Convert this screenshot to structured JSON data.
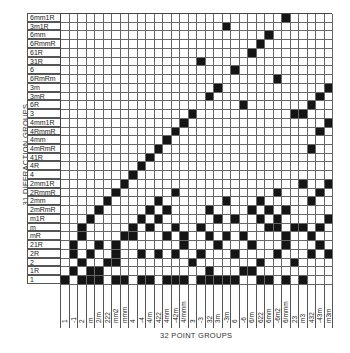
{
  "chart_data": {
    "type": "table",
    "title": "",
    "ylabel": "31 DIFFRACTION GROUPS",
    "xlabel": "32 POINT GROUPS",
    "rows": [
      "6mm1R",
      "3m1R",
      "6mm",
      "6RmmR",
      "61R",
      "31R",
      "6",
      "6RmRm",
      "3m",
      "3mR",
      "6R",
      "3",
      "4mm1R",
      "4RmmR",
      "4mm",
      "4mRmR",
      "41R",
      "4R",
      "4",
      "2mm1R",
      "2RmmR",
      "2mm",
      "2mRmR",
      "m1R",
      "m",
      "mR",
      "21R",
      "2R",
      "2",
      "1R",
      "1"
    ],
    "columns": [
      "1",
      "-1",
      "2",
      "m",
      "2/m",
      "222",
      "mm2",
      "mmm",
      "4",
      "-4",
      "4/m",
      "422",
      "4mm",
      "-42m",
      "4/mmm",
      "3",
      "-3",
      "32",
      "3m",
      "-3m",
      "6",
      "-6",
      "6/m",
      "622",
      "6mm",
      "-6m2",
      "6/mmm",
      "23",
      "m3",
      "432",
      "-43m",
      "m3m"
    ],
    "filled": [
      [
        26
      ],
      [
        19
      ],
      [
        24
      ],
      [
        23
      ],
      [
        22
      ],
      [
        16
      ],
      [
        20
      ],
      [
        25
      ],
      [
        18,
        31
      ],
      [
        17,
        30
      ],
      [
        21,
        29
      ],
      [
        15,
        28,
        27
      ],
      [
        14,
        31
      ],
      [
        13,
        30
      ],
      [
        12
      ],
      [
        11,
        29
      ],
      [
        10
      ],
      [
        9
      ],
      [
        8
      ],
      [
        7,
        28,
        31
      ],
      [
        6,
        13,
        25,
        30
      ],
      [
        5,
        11,
        19,
        23,
        29
      ],
      [
        4,
        10,
        12,
        17,
        22,
        24,
        26
      ],
      [
        3,
        9,
        11,
        18,
        20,
        23,
        25,
        31
      ],
      [
        2,
        8,
        10,
        13,
        16,
        24,
        25,
        27,
        28,
        30
      ],
      [
        2,
        7,
        8,
        12,
        14,
        17,
        19,
        21,
        26,
        29
      ],
      [
        1,
        4,
        6,
        14,
        18,
        22,
        26,
        30
      ],
      [
        1,
        3,
        6,
        9,
        11,
        13,
        16,
        20,
        25,
        29,
        31
      ],
      [
        2,
        5,
        6,
        15,
        23,
        27
      ],
      [
        1,
        3,
        4,
        17,
        21,
        22
      ],
      [
        0,
        2,
        3,
        4,
        6,
        7,
        9,
        10,
        12,
        13,
        14,
        16,
        17,
        18,
        19,
        20,
        23,
        24,
        26,
        28
      ]
    ]
  },
  "labels": {
    "y_axis": "31 DIFFRACTION GROUPS",
    "x_axis": "32 POINT GROUPS"
  }
}
